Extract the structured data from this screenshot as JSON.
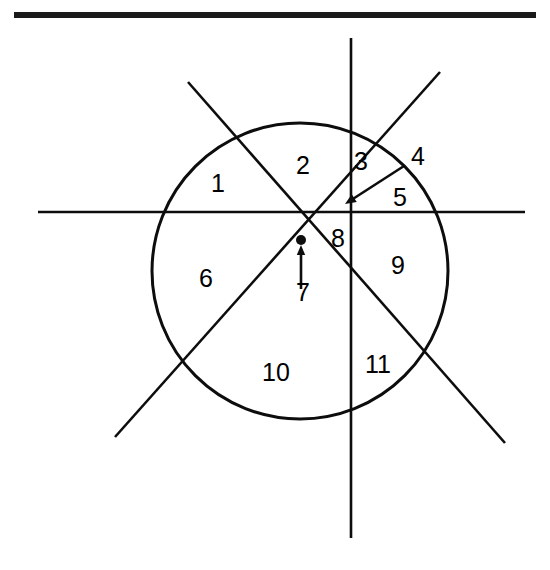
{
  "figure": {
    "background_color": "#ffffff",
    "ink_color": "#0d0d0d",
    "top_rule": {
      "name": "top-rule",
      "x": 14,
      "y": 12,
      "width": 522,
      "height": 6,
      "color": "#1a1a1a"
    },
    "circle": {
      "cx": 300,
      "cy": 271,
      "r": 148,
      "stroke_width": 3
    },
    "lines": [
      {
        "name": "horizontal-axis",
        "x1": 38,
        "y1": 212,
        "x2": 525,
        "y2": 212
      },
      {
        "name": "vertical-axis",
        "x1": 351,
        "y1": 38,
        "x2": 351,
        "y2": 538
      },
      {
        "name": "diagonal-nw-se",
        "x1": 188,
        "y1": 82,
        "x2": 505,
        "y2": 443
      },
      {
        "name": "diagonal-sw-ne",
        "x1": 115,
        "y1": 437,
        "x2": 440,
        "y2": 72
      }
    ],
    "center_dot": {
      "name": "center-intersection-dot",
      "cx": 301,
      "cy": 240,
      "r": 5
    },
    "arrows": [
      {
        "name": "arrow-to-region-4",
        "x1": 404,
        "y1": 166,
        "x2": 345,
        "y2": 204,
        "head_size": 11
      },
      {
        "name": "arrow-to-region-7",
        "x1": 301,
        "y1": 289,
        "x2": 301,
        "y2": 245,
        "head_size": 10
      }
    ],
    "labels": [
      {
        "name": "region-label-1",
        "text": "1",
        "x": 218,
        "y": 185
      },
      {
        "name": "region-label-2",
        "text": "2",
        "x": 303,
        "y": 167
      },
      {
        "name": "region-label-3",
        "text": "3",
        "x": 361,
        "y": 163
      },
      {
        "name": "region-label-4",
        "text": "4",
        "x": 418,
        "y": 158
      },
      {
        "name": "region-label-5",
        "text": "5",
        "x": 400,
        "y": 199
      },
      {
        "name": "region-label-6",
        "text": "6",
        "x": 206,
        "y": 280
      },
      {
        "name": "region-label-7",
        "text": "7",
        "x": 303,
        "y": 294
      },
      {
        "name": "region-label-8",
        "text": "8",
        "x": 338,
        "y": 240
      },
      {
        "name": "region-label-9",
        "text": "9",
        "x": 398,
        "y": 267
      },
      {
        "name": "region-label-10",
        "text": "10",
        "x": 276,
        "y": 374
      },
      {
        "name": "region-label-11",
        "text": "11",
        "x": 378,
        "y": 366
      }
    ]
  }
}
